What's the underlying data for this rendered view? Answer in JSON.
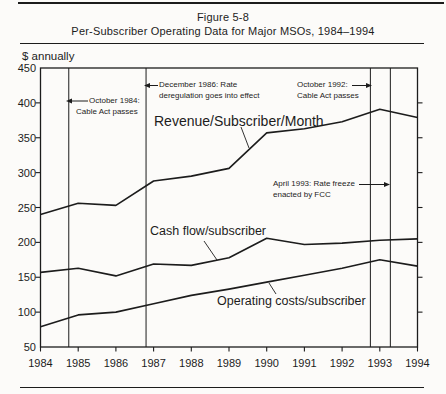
{
  "figure_label": "Figure 5-8",
  "figure_title": "Per-Subscriber Operating Data for Major MSOs, 1984–1994",
  "y_axis_unit": "$ annually",
  "colors": {
    "ink": "#1c1c1c",
    "paper": "#fcfbf9"
  },
  "axes": {
    "y_tick_labels": [
      "450",
      "400",
      "350",
      "300",
      "250",
      "200",
      "150",
      "100",
      "50"
    ],
    "x_tick_labels": [
      "1984",
      "1985",
      "1986",
      "1987",
      "1988",
      "1989",
      "1990",
      "1991",
      "1992",
      "1993",
      "1994"
    ]
  },
  "chart_data": {
    "type": "line",
    "title": "Figure 5-8",
    "subtitle": "Per-Subscriber Operating Data for Major MSOs, 1984–1994",
    "ylabel": "$ annually",
    "xlabel": "",
    "ylim": [
      50,
      450
    ],
    "ytick_interval": 50,
    "grid": false,
    "legend_position": "inline labels with leader lines",
    "x": [
      1984,
      1985,
      1986,
      1987,
      1988,
      1989,
      1990,
      1991,
      1992,
      1993,
      1994
    ],
    "series": [
      {
        "name": "Revenue/Subscriber/Month",
        "values": [
          240,
          256,
          253,
          288,
          295,
          306,
          357,
          363,
          373,
          391,
          379
        ]
      },
      {
        "name": "Cash flow/subscriber",
        "values": [
          157,
          163,
          152,
          169,
          167,
          178,
          206,
          197,
          199,
          203,
          205
        ]
      },
      {
        "name": "Operating costs/subscriber",
        "values": [
          79,
          96,
          100,
          112,
          124,
          133,
          143,
          153,
          163,
          175,
          166
        ]
      }
    ],
    "event_lines": [
      {
        "x_year": 1984.75,
        "arrow": "left",
        "line1": "October 1984:",
        "line2": "Cable Act passes"
      },
      {
        "x_year": 1986.8,
        "arrow": "left",
        "line1": "December 1986: Rate",
        "line2": "deregulation goes into effect"
      },
      {
        "x_year": 1992.75,
        "arrow": "right",
        "line1": "October 1992:",
        "line2": "Cable Act passes"
      },
      {
        "x_year": 1993.28,
        "arrow": "right",
        "line1": "April 1993: Rate freeze",
        "line2": "enacted by FCC"
      }
    ]
  }
}
